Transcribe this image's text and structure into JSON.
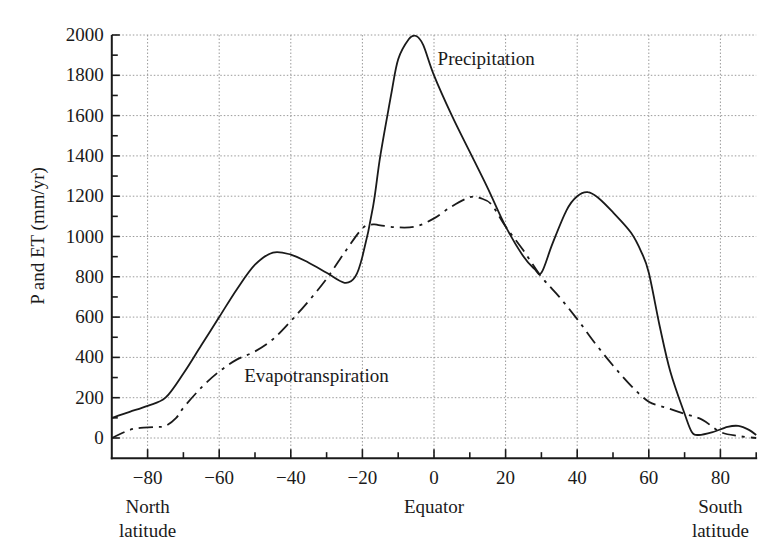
{
  "chart_data": {
    "type": "line",
    "title": "",
    "xlabel": "",
    "ylabel": "P and ET (mm/yr)",
    "xlim": [
      -90,
      90
    ],
    "ylim": [
      -100,
      2000
    ],
    "grid": true,
    "legend": "inline annotations",
    "x_ticks": [
      -80,
      -60,
      -40,
      -20,
      0,
      20,
      40,
      60,
      80
    ],
    "x_tick_labels": [
      "−80",
      "−60",
      "−40",
      "−20",
      "0",
      "20",
      "40",
      "60",
      "80"
    ],
    "y_ticks": [
      0,
      200,
      400,
      600,
      800,
      1000,
      1200,
      1400,
      1600,
      1800,
      2000
    ],
    "y_tick_labels": [
      "0",
      "200",
      "400",
      "600",
      "800",
      "1000",
      "1200",
      "1400",
      "1600",
      "1800",
      "2000"
    ],
    "x_captions": [
      {
        "lines": [
          "North",
          "latitude"
        ],
        "x": -80
      },
      {
        "lines": [
          "Equator"
        ],
        "x": 0
      },
      {
        "lines": [
          "South",
          "latitude"
        ],
        "x": 80
      }
    ],
    "annotations": [
      {
        "text": "Precipitation",
        "x": 1,
        "y": 1850
      },
      {
        "text": "Evapotranspiration",
        "x": -53,
        "y": 280
      }
    ],
    "series": [
      {
        "name": "Precipitation",
        "style": "solid",
        "x": [
          -90,
          -85,
          -80,
          -75,
          -70,
          -65,
          -60,
          -55,
          -50,
          -45,
          -40,
          -35,
          -30,
          -25,
          -22,
          -20,
          -17,
          -15,
          -12,
          -10,
          -7,
          -5,
          -3,
          0,
          5,
          10,
          15,
          20,
          25,
          28,
          30,
          33,
          37,
          40,
          43,
          46,
          50,
          55,
          58,
          60,
          63,
          66,
          70,
          72,
          74,
          78,
          82,
          85,
          88,
          90
        ],
        "values": [
          100,
          130,
          160,
          200,
          320,
          460,
          600,
          740,
          860,
          920,
          910,
          870,
          820,
          770,
          800,
          900,
          1150,
          1400,
          1700,
          1880,
          1980,
          1995,
          1950,
          1800,
          1600,
          1420,
          1240,
          1050,
          900,
          840,
          820,
          960,
          1130,
          1200,
          1220,
          1190,
          1120,
          1020,
          920,
          820,
          560,
          330,
          120,
          30,
          15,
          30,
          55,
          60,
          40,
          15
        ]
      },
      {
        "name": "Evapotranspiration",
        "style": "dash-dot",
        "x": [
          -90,
          -85,
          -82,
          -78,
          -75,
          -72,
          -70,
          -65,
          -60,
          -55,
          -50,
          -45,
          -40,
          -35,
          -30,
          -25,
          -20,
          -17,
          -15,
          -10,
          -5,
          0,
          5,
          10,
          13,
          16,
          20,
          25,
          30,
          35,
          40,
          45,
          50,
          55,
          60,
          65,
          70,
          75,
          80,
          85,
          90
        ],
        "values": [
          0,
          40,
          50,
          55,
          60,
          100,
          150,
          250,
          330,
          390,
          430,
          490,
          580,
          680,
          790,
          920,
          1040,
          1060,
          1055,
          1045,
          1050,
          1090,
          1150,
          1195,
          1190,
          1160,
          1050,
          930,
          800,
          700,
          590,
          470,
          360,
          260,
          180,
          150,
          120,
          90,
          30,
          10,
          0
        ]
      }
    ]
  }
}
